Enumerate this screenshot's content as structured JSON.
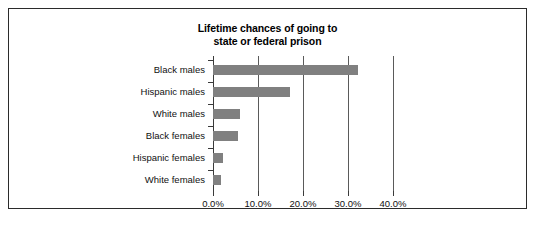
{
  "chart_data": {
    "type": "bar",
    "orientation": "horizontal",
    "title": "Lifetime chances of going to state or federal prison",
    "title_lines": [
      "Lifetime chances of going to",
      "state or federal prison"
    ],
    "xlabel": "",
    "ylabel": "",
    "categories": [
      "Black males",
      "Hispanic males",
      "White males",
      "Black females",
      "Hispanic females",
      "White females"
    ],
    "values": [
      32.2,
      17.2,
      5.9,
      5.6,
      2.2,
      1.8
    ],
    "value_labels": [
      "32.2%",
      "17.2%",
      "5.9%",
      "5.6%",
      "2.2%",
      "1.8%"
    ],
    "xlim": [
      0,
      40
    ],
    "xticks": [
      0,
      10,
      20,
      30,
      40
    ],
    "xtick_labels": [
      "0.0%",
      "10.0%",
      "20.0%",
      "30.0%",
      "40.0%"
    ],
    "grid": true,
    "grid_axis": "x",
    "legend": false,
    "bar_color": "#808080",
    "axis_color": "#3a3a3a",
    "gridline_color": "#5a5a5a",
    "frame_color": "#2b2b2b",
    "background": "#ffffff"
  }
}
